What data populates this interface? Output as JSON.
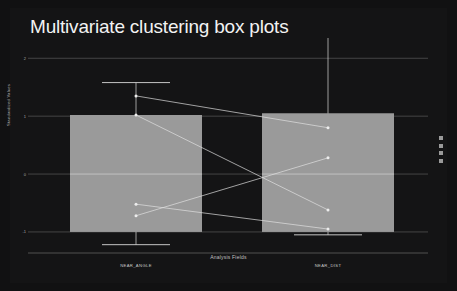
{
  "chart_data": {
    "type": "box",
    "title": "Multivariate clustering box plots",
    "xlabel": "Analysis Fields",
    "ylabel": "Standardized Values",
    "categories": [
      "NEAR_ANGLE",
      "NEAR_DIST"
    ],
    "yticks": [
      2,
      1,
      0,
      -1
    ],
    "ylim": [
      -1.45,
      2.35
    ],
    "grid": true,
    "legend_position": "right",
    "theme": "dark",
    "box_fill": "#9a9a9a",
    "line_color": "#d9d9d9",
    "background": "#141415",
    "boxes": [
      {
        "category": "NEAR_ANGLE",
        "lower_whisker": -1.22,
        "q1": -1.0,
        "median": 0.0,
        "q3": 1.02,
        "upper_whisker": 1.58,
        "outliers": []
      },
      {
        "category": "NEAR_DIST",
        "lower_whisker": -1.05,
        "q1": -1.0,
        "median": 0.0,
        "q3": 1.05,
        "upper_whisker": 2.42,
        "outliers": []
      }
    ],
    "connector_series": [
      {
        "name": "series-1",
        "points": [
          {
            "x": "NEAR_ANGLE",
            "y": 1.35
          },
          {
            "x": "NEAR_DIST",
            "y": 0.8
          }
        ]
      },
      {
        "name": "series-2",
        "points": [
          {
            "x": "NEAR_ANGLE",
            "y": 1.02
          },
          {
            "x": "NEAR_DIST",
            "y": -0.62
          }
        ]
      },
      {
        "name": "series-3",
        "points": [
          {
            "x": "NEAR_ANGLE",
            "y": -0.52
          },
          {
            "x": "NEAR_DIST",
            "y": -0.95
          }
        ]
      },
      {
        "name": "series-4",
        "points": [
          {
            "x": "NEAR_ANGLE",
            "y": -0.72
          },
          {
            "x": "NEAR_DIST",
            "y": 0.28
          }
        ]
      }
    ]
  },
  "legend": {
    "items": [
      {
        "label": ""
      },
      {
        "label": ""
      },
      {
        "label": ""
      },
      {
        "label": ""
      }
    ]
  },
  "ytick_labels": [
    "2",
    "1",
    "0",
    "-1"
  ]
}
